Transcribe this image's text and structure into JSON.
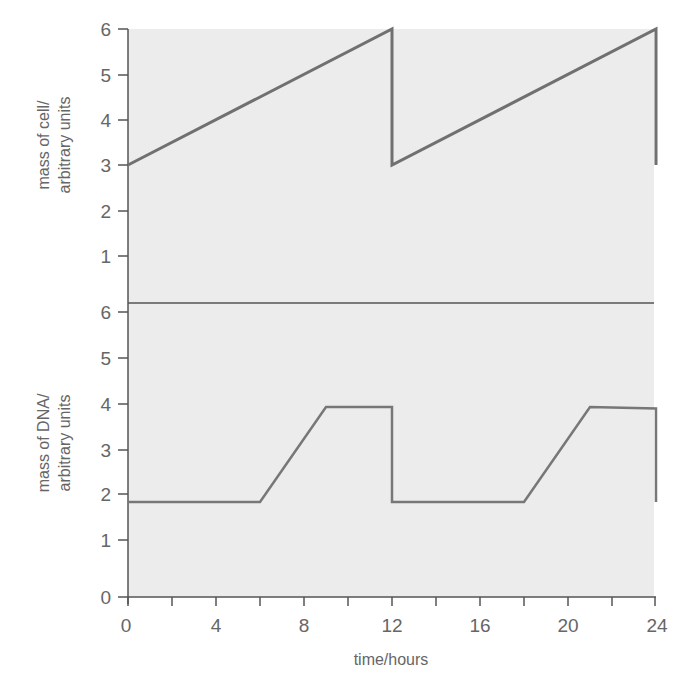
{
  "chart_data": [
    {
      "type": "line",
      "panel": "top",
      "title": "",
      "ylabel": [
        "mass of cell/",
        "arbitrary units"
      ],
      "xlabel": "",
      "ylim": [
        0,
        6
      ],
      "yticks": [
        1,
        2,
        3,
        4,
        5,
        6
      ],
      "xlim": [
        0,
        24
      ],
      "grid": false,
      "series": [
        {
          "name": "mass of cell",
          "x": [
            0,
            12,
            12,
            24,
            24
          ],
          "y": [
            3,
            6,
            3,
            6,
            3
          ]
        }
      ]
    },
    {
      "type": "line",
      "panel": "bottom",
      "title": "",
      "ylabel": [
        "mass of DNA/",
        "arbitrary units"
      ],
      "xlabel": "time/hours",
      "ylim": [
        0,
        6
      ],
      "yticks": [
        0,
        1,
        2,
        3,
        4,
        5,
        6
      ],
      "xlim": [
        0,
        24
      ],
      "xticks": [
        0,
        4,
        8,
        12,
        16,
        20,
        24
      ],
      "xminor_ticks": [
        2,
        6,
        10,
        14,
        18,
        22
      ],
      "grid": false,
      "series": [
        {
          "name": "mass of DNA",
          "x": [
            0,
            6,
            9,
            12,
            12,
            18,
            21,
            24,
            24
          ],
          "y": [
            2,
            2,
            4,
            4,
            2,
            2,
            4,
            3.97,
            2
          ]
        }
      ]
    }
  ],
  "labels": {
    "top_ylabel_line1": "mass of cell/",
    "top_ylabel_line2": "arbitrary units",
    "bottom_ylabel_line1": "mass of DNA/",
    "bottom_ylabel_line2": "arbitrary units",
    "xlabel": "time/hours",
    "xtick_labels": [
      "0",
      "4",
      "8",
      "12",
      "16",
      "20",
      "24"
    ],
    "top_ytick_labels": [
      "1",
      "2",
      "3",
      "4",
      "5",
      "6"
    ],
    "bottom_ytick_labels": [
      "0",
      "1",
      "2",
      "3",
      "4",
      "5",
      "6"
    ]
  },
  "colors": {
    "background": "#ffffff",
    "plot_area": "#ececec",
    "line": "#707070",
    "axis": "#555555",
    "text": "#666666"
  }
}
